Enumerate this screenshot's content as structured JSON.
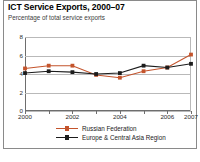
{
  "figure": {
    "title": "ICT Service Exports, 2000–07",
    "subtitle": "Percentage of total service exports",
    "border_color": "#8a8a8a",
    "background": "#ffffff"
  },
  "chart_data": {
    "type": "line",
    "title": "ICT Service Exports, 2000–07",
    "subtitle": "Percentage of total service exports",
    "xlabel": "",
    "ylabel": "Percentage of total service exports",
    "x": [
      2000,
      2001,
      2002,
      2003,
      2004,
      2005,
      2006,
      2007
    ],
    "categories": [
      "2000",
      "2001",
      "2002",
      "2003",
      "2004",
      "2005",
      "2006",
      "2007"
    ],
    "xtick_labels": [
      "2000",
      "",
      "2002",
      "",
      "2004",
      "",
      "2006",
      "2007"
    ],
    "ytick_labels": [
      "0",
      "2",
      "4",
      "6",
      "8"
    ],
    "yticks": [
      0,
      2,
      4,
      6,
      8
    ],
    "ylim": [
      0,
      8
    ],
    "xlim": [
      2000,
      2007
    ],
    "grid": true,
    "grid_color": "#b9b9b9",
    "legend_position": "bottom",
    "series": [
      {
        "name": "Russian Federation",
        "color": "#c4542c",
        "marker": "square",
        "values": [
          4.6,
          4.9,
          4.9,
          3.9,
          3.6,
          4.3,
          4.7,
          6.1
        ]
      },
      {
        "name": "Europe & Central Asia Region",
        "color": "#1c1c1c",
        "marker": "square",
        "values": [
          4.1,
          4.3,
          4.2,
          4.0,
          4.1,
          4.9,
          4.7,
          5.1
        ]
      }
    ]
  }
}
